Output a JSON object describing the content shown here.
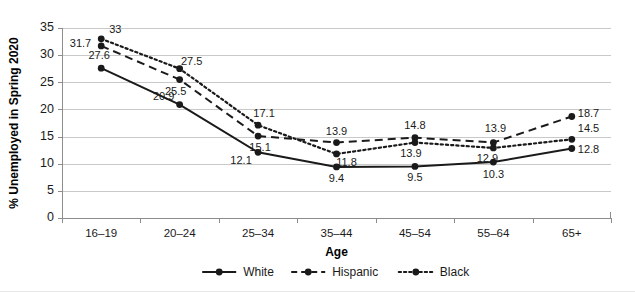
{
  "chart_data": {
    "type": "line",
    "title": "",
    "xlabel": "Age",
    "ylabel": "% Unemployed in Spring 2020",
    "categories": [
      "16–19",
      "20–24",
      "25–34",
      "35–44",
      "45–54",
      "55–64",
      "65+"
    ],
    "ylim": [
      0,
      35
    ],
    "ytick_values": [
      0,
      5,
      10,
      15,
      20,
      25,
      30,
      35
    ],
    "ytick_labels": [
      "0",
      "5",
      "10",
      "15",
      "20",
      "25",
      "30",
      "35"
    ],
    "grid": true,
    "legend_position": "bottom",
    "series": [
      {
        "name": "White",
        "style": "solid",
        "values": [
          27.6,
          20.9,
          12.1,
          9.4,
          9.5,
          10.3,
          12.8
        ],
        "labels": [
          "27.6",
          "20.9",
          "12.1",
          "9.4",
          "9.5",
          "10.3",
          "12.8"
        ],
        "label_offsets": [
          {
            "dx": -2,
            "dy": -9,
            "anchor": "middle"
          },
          {
            "dx": -16,
            "dy": -5,
            "anchor": "middle"
          },
          {
            "dx": -17,
            "dy": 12,
            "anchor": "middle"
          },
          {
            "dx": 0,
            "dy": 15,
            "anchor": "middle"
          },
          {
            "dx": 0,
            "dy": 15,
            "anchor": "middle"
          },
          {
            "dx": 0,
            "dy": 16,
            "anchor": "middle"
          },
          {
            "dx": 6,
            "dy": 4,
            "anchor": "start"
          }
        ]
      },
      {
        "name": "Hispanic",
        "style": "dashed",
        "values": [
          31.7,
          25.5,
          15.1,
          13.9,
          14.8,
          13.9,
          18.7
        ],
        "labels": [
          "31.7",
          "25.5",
          "15.1",
          "13.9",
          "14.8",
          "13.9",
          "18.7"
        ],
        "label_offsets": [
          {
            "dx": -10,
            "dy": 1,
            "anchor": "end"
          },
          {
            "dx": -4,
            "dy": 15,
            "anchor": "middle"
          },
          {
            "dx": 2,
            "dy": 15,
            "anchor": "middle"
          },
          {
            "dx": 0,
            "dy": -8,
            "anchor": "middle"
          },
          {
            "dx": 0,
            "dy": -9,
            "anchor": "middle"
          },
          {
            "dx": 2,
            "dy": -11,
            "anchor": "middle"
          },
          {
            "dx": 6,
            "dy": 1,
            "anchor": "start"
          }
        ]
      },
      {
        "name": "Black",
        "style": "dotted",
        "values": [
          33.0,
          27.5,
          17.1,
          11.8,
          13.9,
          12.9,
          14.5
        ],
        "labels": [
          "33",
          "27.5",
          "17.1",
          "11.8",
          "13.9",
          "12.9",
          "14.5"
        ],
        "label_offsets": [
          {
            "dx": 8,
            "dy": -6,
            "anchor": "start"
          },
          {
            "dx": 12,
            "dy": -4,
            "anchor": "middle"
          },
          {
            "dx": 6,
            "dy": -8,
            "anchor": "middle"
          },
          {
            "dx": 10,
            "dy": 12,
            "anchor": "middle"
          },
          {
            "dx": -4,
            "dy": 14,
            "anchor": "middle"
          },
          {
            "dx": -6,
            "dy": 14,
            "anchor": "middle"
          },
          {
            "dx": 6,
            "dy": -7,
            "anchor": "start"
          }
        ]
      }
    ],
    "colors": {
      "line": "#1a1a1a",
      "grid": "#c9c9c9",
      "axis": "#8d8d8d",
      "background": "#ffffff"
    }
  }
}
